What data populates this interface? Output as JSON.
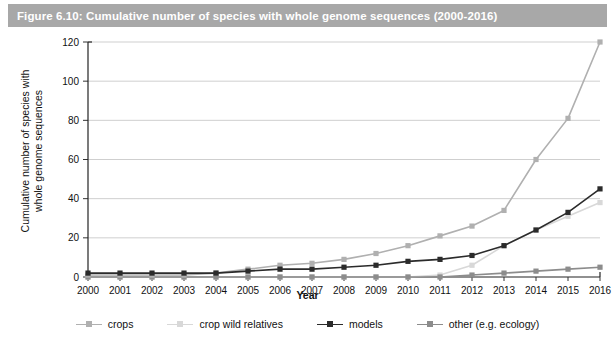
{
  "figure": {
    "title": "Figure 6.10: Cumulative number of species with whole genome sequences (2000-2016)",
    "banner_color": "#a8a8a8",
    "banner_text_color": "#ffffff",
    "background": "#ffffff"
  },
  "chart_data": {
    "type": "line",
    "title": "Cumulative number of species with whole genome sequences (2000-2016)",
    "xlabel": "Year",
    "ylabel": "Cumulative number of species with\nwhole genome sequences",
    "categories": [
      "2000",
      "2001",
      "2002",
      "2003",
      "2004",
      "2005",
      "2006",
      "2007",
      "2008",
      "2009",
      "2010",
      "2011",
      "2012",
      "2013",
      "2014",
      "2015",
      "2016"
    ],
    "x": [
      2000,
      2001,
      2002,
      2003,
      2004,
      2005,
      2006,
      2007,
      2008,
      2009,
      2010,
      2011,
      2012,
      2013,
      2014,
      2015,
      2016
    ],
    "xlim": [
      2000,
      2016
    ],
    "ylim": [
      0,
      120
    ],
    "yticks": [
      0,
      20,
      40,
      60,
      80,
      100,
      120
    ],
    "xticks": [
      "2000",
      "2001",
      "2002",
      "2003",
      "2004",
      "2005",
      "2006",
      "2007",
      "2008",
      "2009",
      "2010",
      "2011",
      "2012",
      "2013",
      "2014",
      "2015",
      "2016"
    ],
    "grid": true,
    "grid_axis": "y",
    "legend_position": "bottom",
    "series": [
      {
        "name": "crops",
        "color": "#b0b0b0",
        "values": [
          1,
          1,
          1,
          1,
          2,
          4,
          6,
          7,
          9,
          12,
          16,
          21,
          26,
          34,
          60,
          81,
          90
        ]
      },
      {
        "name": "crop wild relatives",
        "color": "#d8d8d8",
        "values": [
          0,
          0,
          0,
          0,
          0,
          0,
          0,
          0,
          0,
          0,
          0,
          1,
          6,
          16,
          24,
          31,
          38
        ]
      },
      {
        "name": "models",
        "color": "#2b2b2b",
        "values": [
          2,
          2,
          2,
          2,
          2,
          3,
          4,
          4,
          5,
          6,
          8,
          9,
          11,
          16,
          24,
          33,
          45
        ]
      },
      {
        "name": "other (e.g. ecology)",
        "color": "#8c8c8c",
        "values": [
          0,
          0,
          0,
          0,
          0,
          0,
          0,
          0,
          0,
          0,
          0,
          0,
          1,
          2,
          3,
          4,
          5
        ]
      }
    ],
    "series_overlay": [
      {
        "name": "crops-upper",
        "color": "#b0b0b0",
        "note": "crops series reaching 120 at 2016",
        "values": [
          1,
          1,
          1,
          1,
          2,
          4,
          6,
          7,
          9,
          12,
          16,
          21,
          26,
          34,
          60,
          81,
          120
        ]
      }
    ]
  },
  "legend": {
    "items": [
      {
        "label": "crops",
        "color": "#b0b0b0"
      },
      {
        "label": "crop wild relatives",
        "color": "#d8d8d8"
      },
      {
        "label": "models",
        "color": "#2b2b2b"
      },
      {
        "label": "other (e.g. ecology)",
        "color": "#8c8c8c"
      }
    ]
  }
}
